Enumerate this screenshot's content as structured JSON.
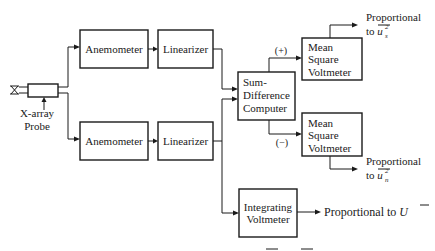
{
  "diagram": {
    "type": "block-diagram",
    "probe": {
      "label_line1": "X-array",
      "label_line2": "Probe",
      "icon": "x-array-probe-icon"
    },
    "channels": [
      {
        "anemometer": "Anemometer",
        "linearizer": "Linearizer"
      },
      {
        "anemometer": "Anemometer",
        "linearizer": "Linearizer"
      }
    ],
    "sum_difference": {
      "line1": "Sum-",
      "line2": "Difference",
      "line3": "Computer"
    },
    "mean_square_upper": {
      "line1": "Mean",
      "line2": "Square",
      "line3": "Voltmeter",
      "sign": "(+)",
      "output_line1": "Proportional",
      "output_line2_prefix": "to ",
      "output_var": "u",
      "output_sub": "s",
      "output_sup": "2"
    },
    "mean_square_lower": {
      "line1": "Mean",
      "line2": "Square",
      "line3": "Voltmeter",
      "sign": "(−)",
      "output_line1": "Proportional",
      "output_line2_prefix": "to ",
      "output_var": "u",
      "output_sub": "n",
      "output_sup": "2"
    },
    "integrating": {
      "line1": "Integrating",
      "line2": "Voltmeter",
      "output_prefix": "Proportional to ",
      "output_var": "U"
    }
  }
}
